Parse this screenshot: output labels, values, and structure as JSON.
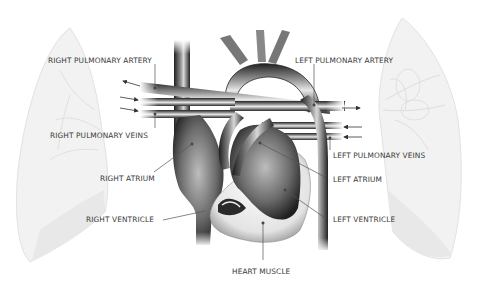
{
  "diagram": {
    "labels": {
      "right_pulmonary_artery": "RIGHT PULMONARY ARTERY",
      "left_pulmonary_artery": "LEFT PULMONARY ARTERY",
      "right_pulmonary_veins": "RIGHT PULMONARY VEINS",
      "left_pulmonary_veins": "LEFT PULMONARY VEINS",
      "right_atrium": "RIGHT ATRIUM",
      "left_atrium": "LEFT ATRIUM",
      "right_ventricle": "RIGHT VENTRICLE",
      "left_ventricle": "LEFT VENTRICLE",
      "heart_muscle": "HEART MUSCLE"
    },
    "colors": {
      "vessel_dark": "#2a2a2a",
      "vessel_mid": "#8a8a8a",
      "vessel_light": "#e6e6e6",
      "lung_fill": "#f1f1f1",
      "lung_line": "#dcdcdc",
      "label_text": "#3a3a3a",
      "leader_line": "#555555"
    },
    "arrows": {
      "right_side": [
        "out-left",
        "in-right",
        "in-right"
      ],
      "left_side": [
        "out-right",
        "in-left",
        "in-left"
      ]
    }
  }
}
